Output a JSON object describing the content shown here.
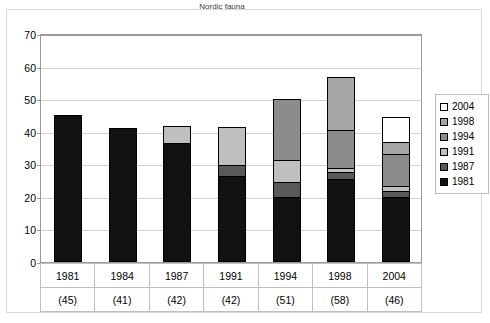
{
  "chart_data": {
    "type": "bar",
    "stacked": true,
    "title": "Nordic fauna",
    "xlabel": "",
    "ylabel": "",
    "ylim": [
      0,
      70
    ],
    "yticks": [
      0,
      10,
      20,
      30,
      40,
      50,
      60,
      70
    ],
    "grid": true,
    "legend_position": "right",
    "categories": [
      "1981",
      "1984",
      "1987",
      "1991",
      "1994",
      "1998",
      "2004"
    ],
    "category_counts": [
      "(45)",
      "(41)",
      "(42)",
      "(42)",
      "(51)",
      "(58)",
      "(46)"
    ],
    "totals": [
      45,
      41,
      42,
      42,
      51,
      58,
      46
    ],
    "series": [
      {
        "name": "1981",
        "color": "#111111",
        "values": [
          45,
          41,
          36.5,
          26.5,
          20,
          25.5,
          20
        ]
      },
      {
        "name": "1987",
        "color": "#595959",
        "values": [
          0,
          0,
          0,
          3.5,
          5,
          2.5,
          2
        ]
      },
      {
        "name": "1991",
        "color": "#bfbfbf",
        "values": [
          0,
          0,
          5.5,
          12,
          7,
          1.5,
          2
        ]
      },
      {
        "name": "1994",
        "color": "#8c8c8c",
        "values": [
          0,
          0,
          0,
          0,
          19,
          12,
          10
        ]
      },
      {
        "name": "1998",
        "color": "#a6a6a6",
        "values": [
          0,
          0,
          0,
          0,
          0,
          16.5,
          4
        ]
      },
      {
        "name": "2004",
        "color": "#ffffff",
        "values": [
          0,
          0,
          0,
          0,
          0,
          0,
          8
        ]
      }
    ]
  },
  "legend": {
    "items": [
      {
        "label": "2004",
        "color": "#ffffff"
      },
      {
        "label": "1998",
        "color": "#a6a6a6"
      },
      {
        "label": "1994",
        "color": "#8c8c8c"
      },
      {
        "label": "1991",
        "color": "#bfbfbf"
      },
      {
        "label": "1987",
        "color": "#595959"
      },
      {
        "label": "1981",
        "color": "#111111"
      }
    ]
  }
}
